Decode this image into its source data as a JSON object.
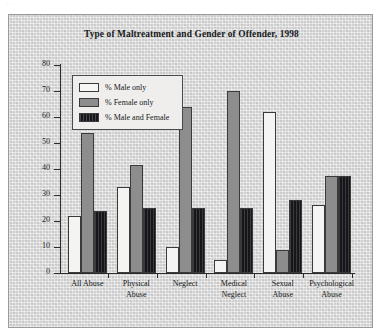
{
  "page": {
    "top_cut_text": "· · ·"
  },
  "figure": {
    "title": "Type of Maltreatment and Gender of Offender, 1998"
  },
  "legend": {
    "entries": [
      {
        "label": "% Male only",
        "color": "#f4f4f2",
        "series_key": "male_only"
      },
      {
        "label": "% Female only",
        "color": "#8d8d8d",
        "series_key": "female_only"
      },
      {
        "label": "% Male and Female",
        "color": "#16161a",
        "series_key": "male_and_female"
      }
    ]
  },
  "chart_data": {
    "type": "bar",
    "title": "Type of Maltreatment and Gender of Offender, 1998",
    "xlabel": "",
    "ylabel": "",
    "ylim": [
      0,
      80
    ],
    "yticks": [
      0,
      10,
      20,
      30,
      40,
      50,
      60,
      70,
      80
    ],
    "ytick_labels": [
      "0",
      "10",
      "20",
      "30",
      "40",
      "50",
      "60",
      "70",
      "80"
    ],
    "grid": false,
    "legend_position": "upper-left-inside",
    "categories": [
      "All Abuse",
      "Physical Abuse",
      "Neglect",
      "Medical Neglect",
      "Sexual Abuse",
      "Psychological Abuse"
    ],
    "category_lines": [
      [
        "All Abuse"
      ],
      [
        "Physical",
        "Abuse"
      ],
      [
        "Neglect"
      ],
      [
        "Medical",
        "Neglect"
      ],
      [
        "Sexual",
        "Abuse"
      ],
      [
        "Psychological",
        "Abuse"
      ]
    ],
    "series": [
      {
        "name": "% Male only",
        "color": "#f4f4f2",
        "values": [
          22,
          33,
          10,
          5,
          62,
          26
        ]
      },
      {
        "name": "% Female only",
        "color": "#8d8d8d",
        "values": [
          54,
          41.5,
          64,
          70,
          9,
          37.5
        ]
      },
      {
        "name": "% Male and Female",
        "color": "#16161a",
        "values": [
          24,
          25,
          25,
          25,
          28,
          37.5
        ]
      }
    ]
  }
}
